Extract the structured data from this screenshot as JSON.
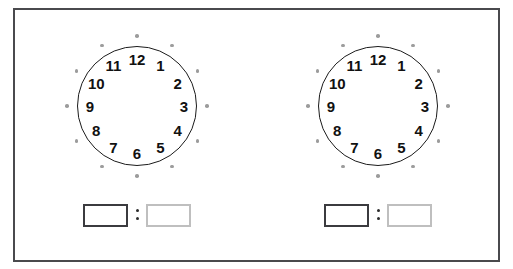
{
  "worksheet": {
    "frame_color": "#4a4a4d",
    "background": "#ffffff",
    "clock_numerals": [
      "1",
      "2",
      "3",
      "4",
      "5",
      "6",
      "7",
      "8",
      "9",
      "10",
      "11",
      "12"
    ],
    "tick_dot_count": 12,
    "tick_dot_color": "#9c9c9c",
    "dial_outline_color": "#1b1b1b"
  },
  "problems": [
    {
      "id": "problem-1",
      "clock": {
        "name": "blank-clock-face",
        "hands": "none",
        "numerals": [
          "1",
          "2",
          "3",
          "4",
          "5",
          "6",
          "7",
          "8",
          "9",
          "10",
          "11",
          "12"
        ]
      },
      "answer": {
        "hours_value": "",
        "hours_placeholder": "",
        "minutes_value": "",
        "minutes_placeholder": "",
        "separator": ":",
        "hours_border_color": "#3b3b3f",
        "minutes_border_color": "#bfbfbf"
      }
    },
    {
      "id": "problem-2",
      "clock": {
        "name": "blank-clock-face",
        "hands": "none",
        "numerals": [
          "1",
          "2",
          "3",
          "4",
          "5",
          "6",
          "7",
          "8",
          "9",
          "10",
          "11",
          "12"
        ]
      },
      "answer": {
        "hours_value": "",
        "hours_placeholder": "",
        "minutes_value": "",
        "minutes_placeholder": "",
        "separator": ":",
        "hours_border_color": "#3b3b3f",
        "minutes_border_color": "#bfbfbf"
      }
    }
  ]
}
